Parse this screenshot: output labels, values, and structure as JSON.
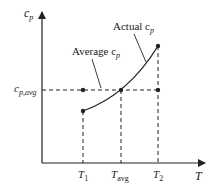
{
  "diagram": {
    "axes": {
      "y_label": "c",
      "y_label_sub": "p",
      "x_label": "T"
    },
    "y_ticks": [
      {
        "label": "c",
        "sub": "p,avg"
      }
    ],
    "x_ticks": [
      {
        "label": "T",
        "sub": "1"
      },
      {
        "label": "T",
        "sub": "avg"
      },
      {
        "label": "T",
        "sub": "2"
      }
    ],
    "annotations": {
      "average": {
        "text": "Average c",
        "sub": "p"
      },
      "actual": {
        "text": "Actual c",
        "sub": "p"
      }
    },
    "colors": {
      "line": "#222222",
      "background": "#ffffff"
    }
  }
}
